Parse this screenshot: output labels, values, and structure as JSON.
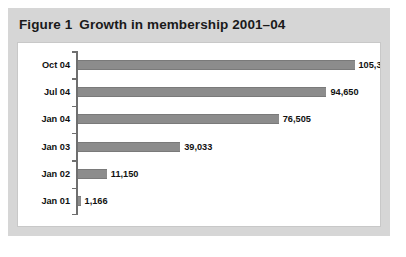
{
  "figure": {
    "label": "Figure 1",
    "title": "Growth in membership 2001–04"
  },
  "chart_data": {
    "type": "bar",
    "orientation": "horizontal",
    "xlabel": "",
    "ylabel": "",
    "categories": [
      "Oct 04",
      "Jul 04",
      "Jan 04",
      "Jan 03",
      "Jan 02",
      "Jan 01"
    ],
    "values": [
      105300,
      94650,
      76505,
      39033,
      11150,
      1166
    ],
    "value_labels": [
      "105,300",
      "94,650",
      "76,505",
      "39,033",
      "11,150",
      "1,166"
    ],
    "xlim": [
      0,
      105300
    ],
    "grid": false,
    "legend": null,
    "series": [
      {
        "name": "Membership",
        "values": [
          105300,
          94650,
          76505,
          39033,
          11150,
          1166
        ]
      }
    ],
    "colors": {
      "bar_fill": "#8c8c8c",
      "bar_edge": "#7a7a7a",
      "axis": "#6f6f6f",
      "plot_background": "#ffffff",
      "frame_background": "#d6d6d6",
      "text": "#111111"
    }
  }
}
